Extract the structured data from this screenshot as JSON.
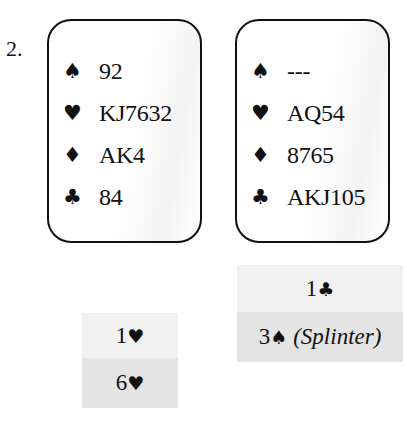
{
  "problem": {
    "number": "2."
  },
  "hands": {
    "left": {
      "spades": {
        "symbol": "♠",
        "cards": "92"
      },
      "hearts": {
        "symbol": "♥",
        "cards": "KJ7632"
      },
      "diamonds": {
        "symbol": "♦",
        "cards": "AK4"
      },
      "clubs": {
        "symbol": "♣",
        "cards": "84"
      }
    },
    "right": {
      "spades": {
        "symbol": "♠",
        "cards": "---"
      },
      "hearts": {
        "symbol": "♥",
        "cards": "AQ54"
      },
      "diamonds": {
        "symbol": "♦",
        "cards": "8765"
      },
      "clubs": {
        "symbol": "♣",
        "cards": "AKJ105"
      }
    }
  },
  "auction": {
    "left": [
      {
        "level": "1",
        "suit": "♥",
        "note": ""
      },
      {
        "level": "6",
        "suit": "♥",
        "note": ""
      }
    ],
    "right": [
      {
        "level": "1",
        "suit": "♣",
        "note": ""
      },
      {
        "level": "3",
        "suit": "♠",
        "note": "(Splinter)"
      }
    ]
  }
}
